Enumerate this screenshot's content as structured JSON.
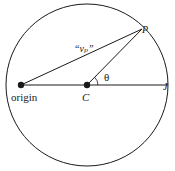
{
  "diagram": {
    "type": "geometry",
    "circle": {
      "cx": 87,
      "cy": 85,
      "r": 81,
      "stroke": "#1a1a1a"
    },
    "points": {
      "origin": {
        "x": 21,
        "y": 85,
        "label": "origin"
      },
      "center": {
        "x": 87,
        "y": 85,
        "label": "C"
      },
      "p": {
        "x": 142,
        "y": 29,
        "label": "P"
      },
      "j": {
        "x": 168,
        "y": 85,
        "label": "J"
      }
    },
    "segment_label": "“vₚ”",
    "segment_label_main": "v",
    "segment_label_sub": "P",
    "angle_label": "θ"
  }
}
